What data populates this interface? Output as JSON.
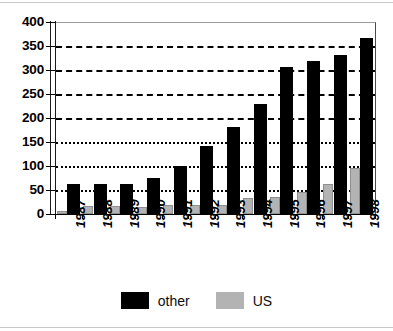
{
  "chart_data": {
    "type": "bar",
    "title": "",
    "subtitle": "",
    "xlabel": "",
    "ylabel": "",
    "categories": [
      "1987",
      "1988",
      "1989",
      "1990",
      "1991",
      "1992",
      "1993",
      "1994",
      "1995",
      "1996",
      "1997",
      "1998"
    ],
    "series": [
      {
        "name": "US",
        "color": "#b3b3b3",
        "values": [
          7,
          17,
          16,
          15,
          19,
          19,
          19,
          33,
          35,
          46,
          62,
          95
        ]
      },
      {
        "name": "other",
        "color": "#000000",
        "values": [
          62,
          62,
          62,
          76,
          100,
          141,
          182,
          230,
          306,
          319,
          332,
          367
        ]
      }
    ],
    "ylim": [
      0,
      400
    ],
    "ytick_values": [
      0,
      50,
      100,
      150,
      200,
      250,
      300,
      350,
      400
    ],
    "ytick_labels": [
      "0",
      "50",
      "100",
      "150",
      "200",
      "250",
      "300",
      "350",
      "400"
    ],
    "grid": "horizontal-dotted",
    "grid_levels": [
      50,
      100,
      150,
      200,
      250,
      300,
      350
    ],
    "legend_position": "bottom-center",
    "bar_order_in_group": [
      "US",
      "other"
    ],
    "xtick_label_rotation": 90
  },
  "legend": {
    "entries": [
      {
        "label": "other",
        "swatch": "black-square-swatch"
      },
      {
        "label": "US",
        "swatch": "gray-square-swatch"
      }
    ]
  },
  "colors": {
    "other": "#000000",
    "us": "#b3b3b3",
    "axis": "#000000",
    "grid": "#000000",
    "background": "#ffffff"
  }
}
